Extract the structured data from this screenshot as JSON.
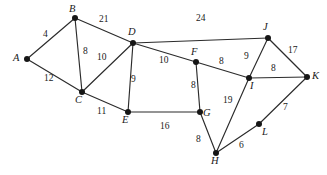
{
  "figure": {
    "kind": "weighted-undirected-graph",
    "background_color": "#ffffff",
    "edge_color": "#2b2b2b",
    "vertex_color": "#161616",
    "text_color": "#1a1a1a",
    "width": 327,
    "height": 175
  },
  "chart_data": {
    "type": "diagram",
    "title": "",
    "xlabel": "",
    "ylabel": "",
    "graph_type": "weighted undirected graph",
    "vertices": [
      {
        "id": "A",
        "label": "A",
        "x": 27,
        "y": 59,
        "label_x": 13,
        "label_y": 53
      },
      {
        "id": "B",
        "label": "B",
        "x": 75,
        "y": 18,
        "label_x": 69,
        "label_y": 4
      },
      {
        "id": "C",
        "label": "C",
        "x": 82,
        "y": 92,
        "label_x": 75,
        "label_y": 95
      },
      {
        "id": "D",
        "label": "D",
        "x": 133,
        "y": 43,
        "label_x": 128,
        "label_y": 27
      },
      {
        "id": "E",
        "label": "E",
        "x": 128,
        "y": 112,
        "label_x": 122,
        "label_y": 115
      },
      {
        "id": "F",
        "label": "F",
        "x": 196,
        "y": 62,
        "label_x": 191,
        "label_y": 47
      },
      {
        "id": "G",
        "label": "G",
        "x": 200,
        "y": 112,
        "label_x": 203,
        "label_y": 108
      },
      {
        "id": "H",
        "label": "H",
        "x": 216,
        "y": 153,
        "label_x": 211,
        "label_y": 156
      },
      {
        "id": "I",
        "label": "I",
        "x": 249,
        "y": 78,
        "label_x": 250,
        "label_y": 81
      },
      {
        "id": "J",
        "label": "J",
        "x": 268,
        "y": 38,
        "label_x": 263,
        "label_y": 22
      },
      {
        "id": "K",
        "label": "K",
        "x": 307,
        "y": 77,
        "label_x": 312,
        "label_y": 71
      },
      {
        "id": "L",
        "label": "L",
        "x": 259,
        "y": 124,
        "label_x": 262,
        "label_y": 127
      }
    ],
    "edges": [
      {
        "from": "A",
        "to": "B",
        "weight": 4,
        "label_x": 43,
        "label_y": 30
      },
      {
        "from": "A",
        "to": "C",
        "weight": 12,
        "label_x": 44,
        "label_y": 74
      },
      {
        "from": "B",
        "to": "C",
        "weight": 8,
        "label_x": 83,
        "label_y": 47
      },
      {
        "from": "B",
        "to": "D",
        "weight": 21,
        "label_x": 99,
        "label_y": 15
      },
      {
        "from": "C",
        "to": "D",
        "weight": 10,
        "label_x": 97,
        "label_y": 53
      },
      {
        "from": "C",
        "to": "E",
        "weight": 11,
        "label_x": 97,
        "label_y": 107
      },
      {
        "from": "D",
        "to": "E",
        "weight": 9,
        "label_x": 131,
        "label_y": 75
      },
      {
        "from": "D",
        "to": "F",
        "weight": 10,
        "label_x": 159,
        "label_y": 56
      },
      {
        "from": "D",
        "to": "J",
        "weight": 24,
        "label_x": 196,
        "label_y": 14
      },
      {
        "from": "E",
        "to": "G",
        "weight": 16,
        "label_x": 160,
        "label_y": 122
      },
      {
        "from": "F",
        "to": "G",
        "weight": 8,
        "label_x": 191,
        "label_y": 81
      },
      {
        "from": "F",
        "to": "I",
        "weight": 8,
        "label_x": 219,
        "label_y": 57
      },
      {
        "from": "G",
        "to": "H",
        "weight": 8,
        "label_x": 196,
        "label_y": 135
      },
      {
        "from": "H",
        "to": "I",
        "weight": 19,
        "label_x": 223,
        "label_y": 96
      },
      {
        "from": "H",
        "to": "L",
        "weight": 6,
        "label_x": 239,
        "label_y": 141
      },
      {
        "from": "I",
        "to": "J",
        "weight": 9,
        "label_x": 244,
        "label_y": 52
      },
      {
        "from": "I",
        "to": "K",
        "weight": 8,
        "label_x": 271,
        "label_y": 64
      },
      {
        "from": "J",
        "to": "K",
        "weight": 17,
        "label_x": 288,
        "label_y": 46
      },
      {
        "from": "L",
        "to": "K",
        "weight": 7,
        "label_x": 283,
        "label_y": 103
      }
    ]
  }
}
